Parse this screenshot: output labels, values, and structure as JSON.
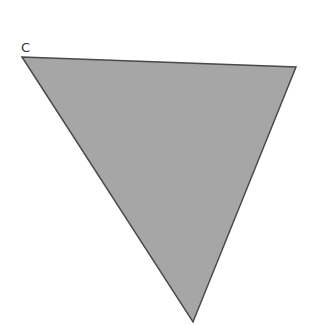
{
  "diagram": {
    "vertex_labels": [
      {
        "text": "C",
        "x": 21,
        "y": 41
      }
    ],
    "triangle": {
      "points": [
        [
          22,
          57
        ],
        [
          296,
          67
        ],
        [
          193,
          322
        ]
      ],
      "fill": "#a6a6a6",
      "stroke": "#4a4a4a"
    }
  }
}
